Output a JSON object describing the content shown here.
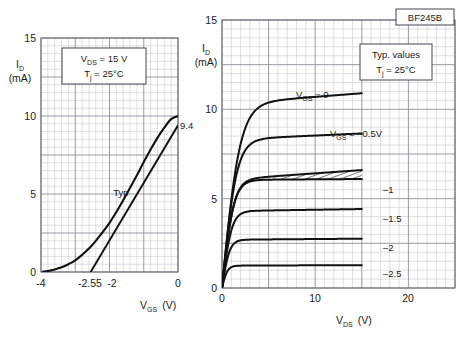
{
  "figure": {
    "background": "#ffffff",
    "grid_minor_color": "#c9c9cf",
    "grid_major_color": "#8e8e98",
    "curve_color": "#111111",
    "part_number": "BF245B"
  },
  "chart_data": [
    {
      "id": "transfer",
      "type": "line",
      "title": "",
      "xlabel": "V_GS",
      "xunit": "(V)",
      "ylabel": "I_D",
      "yunit": "(mA)",
      "xlim": [
        -4,
        0
      ],
      "ylim": [
        0,
        15
      ],
      "xticks": [
        "-4",
        "-2.55",
        "-2",
        "0"
      ],
      "xtick_values": [
        -4,
        -2.55,
        -2,
        0
      ],
      "yticks": [
        "0",
        "5",
        "10",
        "15"
      ],
      "ytick_values": [
        0,
        5,
        10,
        15
      ],
      "grid": "minor 0.2 V / 0.5 mA, major 1 V / 2.5 mA",
      "legend": "none",
      "conditions": [
        "V_DS = 15 V",
        "T_j = 25°C"
      ],
      "condition_parts": [
        {
          "sym": "V",
          "sub": "DS",
          "rest": " = 15 V"
        },
        {
          "sym": "T",
          "sub": "j",
          "rest": " = 25°C"
        }
      ],
      "annotations": [
        {
          "name": "typ-curve-label",
          "text": "Typ",
          "x": -1.75,
          "y": 3.6
        },
        {
          "name": "idss-value-label",
          "text": "9.4",
          "x": 0.05,
          "y": 9.4
        }
      ],
      "series": [
        {
          "name": "Typ transfer characteristic",
          "x": [
            -3.95,
            -3.8,
            -3.6,
            -3.4,
            -3.2,
            -3.0,
            -2.8,
            -2.6,
            -2.4,
            -2.2,
            -2.0,
            -1.8,
            -1.6,
            -1.4,
            -1.2,
            -1.0,
            -0.8,
            -0.6,
            -0.4,
            -0.2,
            0.0
          ],
          "y": [
            0.02,
            0.06,
            0.16,
            0.3,
            0.5,
            0.75,
            1.1,
            1.5,
            2.0,
            2.55,
            3.15,
            3.85,
            4.6,
            5.4,
            6.2,
            7.05,
            7.85,
            8.6,
            9.25,
            9.8,
            10.0
          ]
        },
        {
          "name": "Tangent (slope) line",
          "x": [
            -2.55,
            0.0
          ],
          "y": [
            0.0,
            9.4
          ]
        }
      ]
    },
    {
      "id": "output",
      "type": "line",
      "title": "",
      "xlabel": "V_DS",
      "xunit": "(V)",
      "ylabel": "I_D",
      "yunit": "(mA)",
      "xlim": [
        0,
        25
      ],
      "ylim": [
        0,
        15
      ],
      "xticks": [
        "0",
        "10",
        "20"
      ],
      "xtick_values": [
        0,
        10,
        20
      ],
      "yticks": [
        "0",
        "5",
        "10",
        "15"
      ],
      "ytick_values": [
        0,
        5,
        10,
        15
      ],
      "grid": "minor 1 V / 0.5 mA, major 5 V / 2.5 mA",
      "conditions": [
        "Typ. values",
        "T_j = 25°C"
      ],
      "condition_parts": [
        {
          "sym": "",
          "sub": "",
          "rest": "Typ. values"
        },
        {
          "sym": "T",
          "sub": "j",
          "rest": " = 25°C"
        }
      ],
      "part_label": "BF245B",
      "curve_labels": [
        {
          "name": "vgs-0",
          "prefix": "V",
          "sub": "GS",
          "rest": " = 0",
          "value": 0,
          "sat": 10.3
        },
        {
          "name": "vgs-0p5",
          "prefix": "V",
          "sub": "GS",
          "rest": " = –0.5V",
          "value": -0.5,
          "sat": 8.3
        },
        {
          "name": "vgs-1",
          "prefix": "",
          "sub": "",
          "rest": "–1",
          "value": -1,
          "sat": 6.1
        },
        {
          "name": "vgs-1p5",
          "prefix": "",
          "sub": "",
          "rest": "–1.5",
          "value": -1.5,
          "sat": 4.3
        },
        {
          "name": "vgs-2",
          "prefix": "",
          "sub": "",
          "rest": "–2",
          "value": -2,
          "sat": 2.7
        },
        {
          "name": "vgs-2p5",
          "prefix": "",
          "sub": "",
          "rest": "–2.5",
          "value": -2.5,
          "sat": 1.25
        }
      ],
      "series": [
        {
          "name": "V_GS = 0",
          "sat": 10.3,
          "knee": 2.6,
          "xmax": 15,
          "tail": 0.6
        },
        {
          "name": "V_GS = -0.5",
          "sat": 8.3,
          "knee": 2.1,
          "xmax": 15,
          "tail": 0.35
        },
        {
          "name": "V_GS = -1",
          "sat": 6.05,
          "knee": 1.7,
          "xmax": 15,
          "tail": 0.05
        },
        {
          "name": "V_GS = -1 upper (tolerance)",
          "sat": 6.05,
          "knee": 1.7,
          "xmax": 15,
          "tail": 0.55
        },
        {
          "name": "V_GS = -1.5",
          "sat": 4.3,
          "knee": 1.4,
          "xmax": 15,
          "tail": 0.12
        },
        {
          "name": "V_GS = -2",
          "sat": 2.7,
          "knee": 1.1,
          "xmax": 15,
          "tail": 0.06
        },
        {
          "name": "V_GS = -2.5",
          "sat": 1.25,
          "knee": 0.8,
          "xmax": 15,
          "tail": 0.03
        }
      ],
      "hatched_band": {
        "name": "tolerance-band",
        "from_x": 5.5,
        "to_x": 15,
        "lower_series": "V_GS = -1",
        "upper_series": "V_GS = -1 upper (tolerance)"
      }
    }
  ]
}
